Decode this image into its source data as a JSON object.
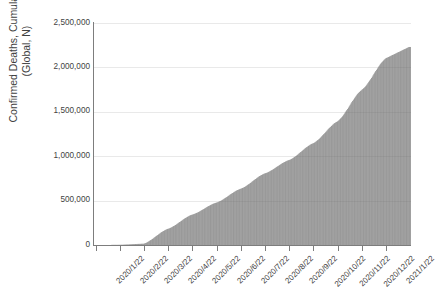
{
  "chart_data": {
    "type": "bar",
    "title": "",
    "subtitle": "",
    "xlabel": "",
    "ylabel": "Confirmed Deaths, Cumulative (Global, N)",
    "ylabel_lines": [
      "Confirmed Deaths, Cumulative",
      "(Global, N)"
    ],
    "ylim": [
      0,
      2500000
    ],
    "ytick_labels": [
      "2,500,000",
      "2,000,000",
      "1,500,000",
      "1,000,000",
      "500,000",
      "0"
    ],
    "ytick_values": [
      2500000,
      2000000,
      1500000,
      1000000,
      500000,
      0
    ],
    "grid": true,
    "grid_axis": "y",
    "legend": false,
    "legend_position": "none",
    "xtick_rotation": -45,
    "categories": [
      "2020/1/22",
      "2020/2/22",
      "2020/3/22",
      "2020/4/22",
      "2020/5/22",
      "2020/6/22",
      "2020/7/22",
      "2020/8/22",
      "2020/9/22",
      "2020/10/22",
      "2020/11/22",
      "2020/12/22",
      "2021/1/22"
    ],
    "x_start": "2020/1/22",
    "x_end": "2021/1/22",
    "n_bars": 372,
    "series": [
      {
        "name": "Confirmed Deaths, Cumulative (Global, N)",
        "color": "#6a6a6a",
        "milestones": [
          {
            "date": "2020/1/22",
            "value": 17
          },
          {
            "date": "2020/2/22",
            "value": 2460
          },
          {
            "date": "2020/3/22",
            "value": 14652
          },
          {
            "date": "2020/4/22",
            "value": 183027
          },
          {
            "date": "2020/5/22",
            "value": 342867
          },
          {
            "date": "2020/6/22",
            "value": 477807
          },
          {
            "date": "2020/7/22",
            "value": 633506
          },
          {
            "date": "2020/8/22",
            "value": 806410
          },
          {
            "date": "2020/9/22",
            "value": 956882
          },
          {
            "date": "2020/10/22",
            "value": 1146651
          },
          {
            "date": "2020/11/22",
            "value": 1392712
          },
          {
            "date": "2020/12/22",
            "value": 1746301
          },
          {
            "date": "2021/1/22",
            "value": 2103154
          }
        ],
        "peak_value": 2230000,
        "peak_label": "2,230,000"
      }
    ],
    "colors": {
      "bar": "#6a6a6a",
      "bar_gap": "#ffffff",
      "gridline": "#e9e9e9",
      "axis": "#7d7d7d",
      "text": "#3f3f3f",
      "background": "#ffffff"
    }
  }
}
